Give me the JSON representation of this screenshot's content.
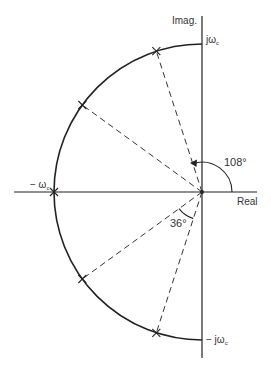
{
  "diagram": {
    "axes": {
      "imag_label": "Imag.",
      "real_label": "Real"
    },
    "labels": {
      "top": "jω",
      "top_sub": "c",
      "bottom": "− jω",
      "bottom_sub": "c",
      "left": "− ω",
      "left_sub": "c"
    },
    "angles": {
      "first_pole": "108°",
      "spacing": "36°"
    },
    "poles_deg": [
      108,
      144,
      180,
      216,
      252
    ],
    "colors": {
      "line": "#222222",
      "text": "#333333",
      "background": "#ffffff"
    }
  }
}
